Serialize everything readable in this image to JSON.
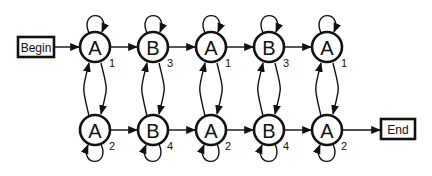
{
  "diagram": {
    "type": "state-transition-graph",
    "begin_label": "Begin",
    "end_label": "End",
    "columns": [
      {
        "top": {
          "label": "A",
          "index": "1"
        },
        "bottom": {
          "label": "A",
          "index": "2"
        }
      },
      {
        "top": {
          "label": "B",
          "index": "3"
        },
        "bottom": {
          "label": "B",
          "index": "4"
        }
      },
      {
        "top": {
          "label": "A",
          "index": "1"
        },
        "bottom": {
          "label": "A",
          "index": "2"
        }
      },
      {
        "top": {
          "label": "B",
          "index": "3"
        },
        "bottom": {
          "label": "B",
          "index": "4"
        }
      },
      {
        "top": {
          "label": "A",
          "index": "1"
        },
        "bottom": {
          "label": "A",
          "index": "2"
        }
      }
    ],
    "edges": {
      "begin_to": "column-0-top",
      "end_from": "column-4-bottom",
      "horizontal": "each node to next node in same row",
      "vertical": "bidirectional between top and bottom in each column",
      "self_loops": "every node"
    },
    "colors": {
      "stroke": "#111111",
      "background": "#ffffff"
    }
  }
}
